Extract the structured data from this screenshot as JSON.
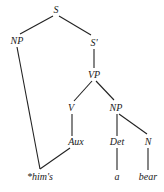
{
  "diagram": {
    "type": "syntax-tree",
    "nodes": {
      "S": {
        "label": "S",
        "x": 56,
        "y": 13
      },
      "NP_subj": {
        "label": "NP",
        "x": 17,
        "y": 44
      },
      "S_bar": {
        "label": "S'",
        "x": 94,
        "y": 46
      },
      "VP": {
        "label": "VP",
        "x": 94,
        "y": 78
      },
      "V": {
        "label": "V",
        "x": 71,
        "y": 111
      },
      "NP_obj": {
        "label": "NP",
        "x": 116,
        "y": 111
      },
      "Aux": {
        "label": "Aux",
        "x": 76,
        "y": 145
      },
      "Det": {
        "label": "Det",
        "x": 117,
        "y": 145
      },
      "N": {
        "label": "N",
        "x": 148,
        "y": 145
      },
      "word_hims": {
        "label": "*him's",
        "x": 40,
        "y": 180
      },
      "word_a": {
        "label": "a",
        "x": 117,
        "y": 180
      },
      "word_bear": {
        "label": "bear",
        "x": 148,
        "y": 180
      }
    },
    "edges": [
      {
        "from": "S",
        "to": "NP_subj",
        "x1": 53,
        "y1": 16,
        "x2": 20,
        "y2": 34
      },
      {
        "from": "S",
        "to": "S_bar",
        "x1": 59,
        "y1": 16,
        "x2": 91,
        "y2": 35
      },
      {
        "from": "S_bar",
        "to": "VP",
        "x1": 94,
        "y1": 49,
        "x2": 94,
        "y2": 68
      },
      {
        "from": "VP",
        "to": "V",
        "x1": 92,
        "y1": 81,
        "x2": 74,
        "y2": 101
      },
      {
        "from": "VP",
        "to": "NP_obj",
        "x1": 96,
        "y1": 81,
        "x2": 114,
        "y2": 100
      },
      {
        "from": "V",
        "to": "Aux",
        "x1": 72,
        "y1": 114,
        "x2": 72,
        "y2": 136
      },
      {
        "from": "NP_obj",
        "to": "Det",
        "x1": 117,
        "y1": 114,
        "x2": 117,
        "y2": 136
      },
      {
        "from": "NP_obj",
        "to": "N",
        "x1": 119,
        "y1": 114,
        "x2": 147,
        "y2": 134
      },
      {
        "from": "NP_subj",
        "to": "word_hims",
        "x1": 17,
        "y1": 47,
        "x2": 40,
        "y2": 169
      },
      {
        "from": "Aux",
        "to": "word_hims",
        "x1": 70,
        "y1": 148,
        "x2": 40,
        "y2": 169
      },
      {
        "from": "Det",
        "to": "word_a",
        "x1": 117,
        "y1": 148,
        "x2": 117,
        "y2": 170
      },
      {
        "from": "N",
        "to": "word_bear",
        "x1": 148,
        "y1": 148,
        "x2": 148,
        "y2": 170
      }
    ],
    "colors": {
      "line": "#222222",
      "text": "#1a1a1a",
      "background": "#ffffff"
    }
  }
}
